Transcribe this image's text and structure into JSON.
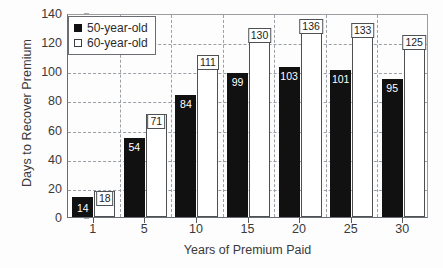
{
  "chart_data": {
    "type": "bar",
    "title": "",
    "xlabel": "Years of Premium Paid",
    "ylabel": "Days to Recover Premium",
    "categories": [
      "1",
      "5",
      "10",
      "15",
      "20",
      "25",
      "30"
    ],
    "series": [
      {
        "name": "50-year-old",
        "values": [
          14,
          54,
          84,
          99,
          103,
          101,
          95
        ],
        "color": "#111111"
      },
      {
        "name": "60-year-old",
        "values": [
          18,
          71,
          111,
          130,
          136,
          133,
          125
        ],
        "color": "#ffffff"
      }
    ],
    "ylim": [
      0,
      140
    ],
    "yticks": [
      0,
      20,
      40,
      60,
      80,
      100,
      120,
      140
    ],
    "ytick_labels": [
      "0",
      "20",
      "40",
      "60",
      "80",
      "100",
      "120",
      "140"
    ],
    "grid": "horizontal-and-vertical-dashed",
    "legend_position": "top-left",
    "data_labels": true
  },
  "legend": {
    "items": [
      {
        "label": "50-year-old",
        "swatch": "filled-square"
      },
      {
        "label": "60-year-old",
        "swatch": "hollow-square"
      }
    ]
  },
  "axes": {
    "y_title": "Days to Recover Premium",
    "x_title": "Years of Premium Paid"
  }
}
